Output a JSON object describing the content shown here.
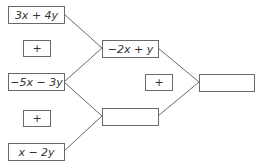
{
  "diagram": {
    "type": "addition-pyramid",
    "nodes": {
      "left_top": {
        "label": "3x + 4y"
      },
      "left_plus_1": {
        "label": "+"
      },
      "left_mid": {
        "label": "−5x − 3y"
      },
      "left_plus_2": {
        "label": "+"
      },
      "left_bottom": {
        "label": "x − 2y"
      },
      "mid_top": {
        "label": "−2x + y"
      },
      "mid_plus": {
        "label": "+"
      },
      "mid_bottom": {
        "label": ""
      },
      "result": {
        "label": ""
      }
    },
    "edges": [
      [
        "left_top",
        "mid_top"
      ],
      [
        "left_mid",
        "mid_top"
      ],
      [
        "left_mid",
        "mid_bottom"
      ],
      [
        "left_bottom",
        "mid_bottom"
      ],
      [
        "mid_top",
        "result"
      ],
      [
        "mid_bottom",
        "result"
      ]
    ],
    "colors": {
      "line": "#6a6a6a",
      "text": "#333333"
    }
  }
}
